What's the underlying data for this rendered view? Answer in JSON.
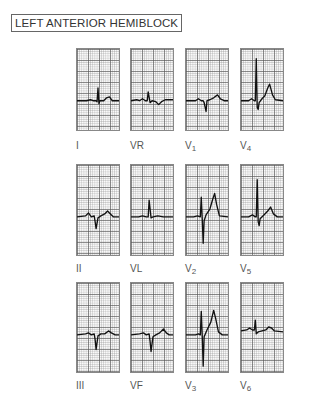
{
  "title": "LEFT ANTERIOR HEMIBLOCK",
  "leads": [
    {
      "id": "I",
      "label": "I",
      "sub": "",
      "path": "M0,53 L10,53 L14,52 L17,53 L20,53 L21,54 L22,40 L23,56 L24,53 L28,53 L31,50 L34,49 L37,53 L44,53"
    },
    {
      "id": "VR",
      "label": "VR",
      "sub": "",
      "path": "M0,53 L6,52 L9,53 L12,51 L15,53 L17,53 L18,44 L20,55 L22,53 L26,54 L29,57 L32,54 L36,52 L44,52"
    },
    {
      "id": "V1",
      "label": "V",
      "sub": "1",
      "path": "M0,53 L10,53 L13,51 L16,53 L18,53 L19,55 L21,64 L22,53 L25,52 L29,50 L33,47 L36,51 L40,53 L44,53"
    },
    {
      "id": "V4",
      "label": "V",
      "sub": "4",
      "path": "M0,53 L8,53 L11,51 L14,53 L15,53 L16,10 L17,60 L18,62 L19,55 L22,51 L25,48 L28,40 L30,36 L33,47 L36,52 L44,53"
    },
    {
      "id": "II",
      "label": "II",
      "sub": "",
      "path": "M0,53 L9,52 L12,49 L15,53 L18,52 L19,58 L20,65 L22,54 L25,52 L29,50 L32,47 L35,50 L38,53 L44,53"
    },
    {
      "id": "VL",
      "label": "VL",
      "sub": "",
      "path": "M0,53 L8,53 L12,52 L16,53 L18,53 L19,36 L21,54 L23,53 L28,52 L34,53 L44,53"
    },
    {
      "id": "V2",
      "label": "V",
      "sub": "2",
      "path": "M0,53 L8,53 L12,52 L15,53 L16,33 L17,55 L18,80 L19,57 L21,51 L25,45 L28,35 L30,29 L32,40 L35,52 L44,53"
    },
    {
      "id": "V5",
      "label": "V",
      "sub": "5",
      "path": "M0,53 L8,53 L12,51 L15,53 L16,53 L17,15 L18,58 L19,62 L20,55 L24,51 L28,47 L31,43 L34,50 L38,53 L44,53"
    },
    {
      "id": "III",
      "label": "III",
      "sub": "",
      "path": "M0,53 L9,52 L12,51 L15,53 L18,52 L19,58 L20,68 L22,54 L25,52 L29,52 L33,49 L36,51 L40,53 L44,53"
    },
    {
      "id": "VF",
      "label": "VF",
      "sub": "",
      "path": "M0,53 L9,52 L13,51 L16,53 L19,52 L20,60 L21,70 L23,55 L26,53 L30,51 L34,47 L37,51 L40,53 L44,53"
    },
    {
      "id": "V3",
      "label": "V",
      "sub": "3",
      "path": "M0,53 L10,53 L13,52 L15,53 L16,29 L17,54 L18,85 L19,55 L22,48 L26,40 L29,28 L31,36 L34,50 L38,53 L44,53"
    },
    {
      "id": "V6",
      "label": "V",
      "sub": "6",
      "path": "M0,49 L6,48 L9,46 L12,48 L14,48 L15,38 L16,52 L18,50 L22,49 L26,48 L29,45 L32,46 L35,49 L44,50"
    }
  ]
}
